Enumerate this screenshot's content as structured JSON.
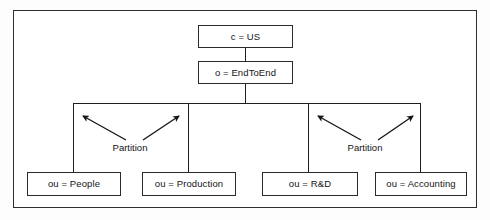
{
  "diagram": {
    "frame": {
      "border_color": "#2e2e2e",
      "background": "#ffffff"
    },
    "line_color": "#1f1f1f",
    "nodes": [
      {
        "id": "country",
        "label": "c = US",
        "level": "root"
      },
      {
        "id": "org",
        "label": "o = EndToEnd",
        "level": "organization"
      },
      {
        "id": "people",
        "label": "ou = People",
        "level": "organizational-unit"
      },
      {
        "id": "production",
        "label": "ou = Production",
        "level": "organizational-unit"
      },
      {
        "id": "rd",
        "label": "ou = R&D",
        "level": "organizational-unit"
      },
      {
        "id": "accounting",
        "label": "ou = Accounting",
        "level": "organizational-unit"
      }
    ],
    "annotations": [
      {
        "id": "partition-left",
        "label": "Partition",
        "points_to": [
          "ou = People",
          "ou = Production"
        ]
      },
      {
        "id": "partition-right",
        "label": "Partition",
        "points_to": [
          "ou = R&D",
          "ou = Accounting"
        ]
      }
    ]
  }
}
